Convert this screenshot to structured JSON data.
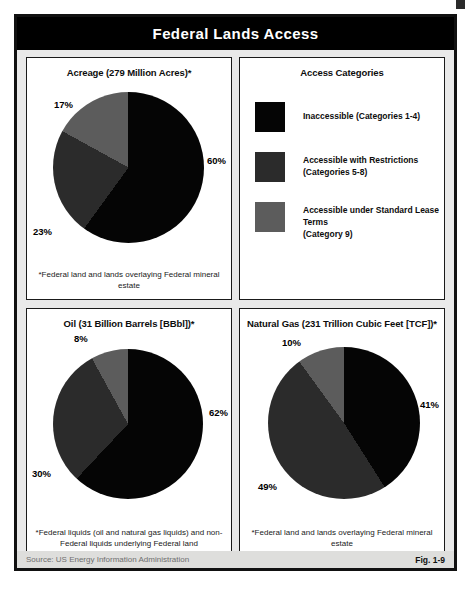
{
  "header": {
    "title": "Federal Lands Access"
  },
  "colors": {
    "inaccessible": "#050505",
    "restricted": "#2b2b2b",
    "standard_lease": "#5c5c5c",
    "frame": "#111111",
    "header_bg": "#000000",
    "footer_bg": "#dededc"
  },
  "legend": {
    "title": "Access Categories",
    "items": [
      {
        "label": "Inaccessible (Categories 1-4)",
        "color": "#050505",
        "two_line": false
      },
      {
        "label": "Accessible with Restrictions\n(Categories 5-8)",
        "color": "#2b2b2b",
        "two_line": true
      },
      {
        "label": "Accessible under Standard Lease Terms\n(Category 9)",
        "color": "#5c5c5c",
        "two_line": true
      }
    ]
  },
  "footer": {
    "source": "Source:  US Energy Information Administration",
    "figure": "Fig. 1-9"
  },
  "chart_data": [
    {
      "type": "pie",
      "id": "acreage",
      "title": "Acreage (279 Million Acres)*",
      "footnote": "*Federal land and lands overlaying Federal mineral estate",
      "categories": [
        "Inaccessible (Categories 1-4)",
        "Accessible with Restrictions (Categories 5-8)",
        "Accessible under Standard Lease Terms (Category 9)"
      ],
      "values": [
        60,
        23,
        17
      ],
      "labels": [
        "60%",
        "23%",
        "17%"
      ],
      "colors": [
        "#050505",
        "#2b2b2b",
        "#5c5c5c"
      ],
      "units": "percent of 279 million acres",
      "start_angle_deg": 0,
      "direction": "clockwise"
    },
    {
      "type": "pie",
      "id": "oil",
      "title": "Oil (31 Billion Barrels [BBbl])*",
      "footnote": "*Federal liquids (oil and natural gas liquids)\nand non-Federal liquids underlying Federal land",
      "categories": [
        "Inaccessible (Categories 1-4)",
        "Accessible with Restrictions (Categories 5-8)",
        "Accessible under Standard Lease Terms (Category 9)"
      ],
      "values": [
        62,
        30,
        8
      ],
      "labels": [
        "62%",
        "30%",
        "8%"
      ],
      "colors": [
        "#050505",
        "#2b2b2b",
        "#5c5c5c"
      ],
      "units": "percent of 31 billion barrels",
      "start_angle_deg": 0,
      "direction": "clockwise"
    },
    {
      "type": "pie",
      "id": "gas",
      "title": "Natural Gas (231 Trillion Cubic Feet [TCF])*",
      "footnote": "*Federal land and lands overlaying Federal mineral estate",
      "categories": [
        "Inaccessible (Categories 1-4)",
        "Accessible with Restrictions (Categories 5-8)",
        "Accessible under Standard Lease Terms (Category 9)"
      ],
      "values": [
        41,
        49,
        10
      ],
      "labels": [
        "41%",
        "49%",
        "10%"
      ],
      "colors": [
        "#050505",
        "#2b2b2b",
        "#5c5c5c"
      ],
      "units": "percent of 231 trillion cubic feet",
      "start_angle_deg": 0,
      "direction": "clockwise"
    }
  ]
}
